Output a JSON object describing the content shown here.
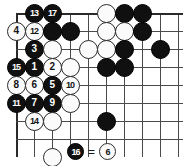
{
  "diagram": {
    "kind": "go-game-diagram",
    "board": {
      "origin_x": 16,
      "origin_y": 13,
      "spacing": 18,
      "cols": 10,
      "rows": 8,
      "left_edge": true,
      "top_edge": true,
      "star_points": [
        {
          "col": 8,
          "row": 2
        }
      ]
    },
    "stones": [
      {
        "col": 1,
        "row": 0,
        "color": "black",
        "label": "13"
      },
      {
        "col": 2,
        "row": 0,
        "color": "black",
        "label": "17"
      },
      {
        "col": 5,
        "row": 0,
        "color": "white",
        "label": ""
      },
      {
        "col": 6,
        "row": 0,
        "color": "black",
        "label": ""
      },
      {
        "col": 7,
        "row": 0,
        "color": "black",
        "label": ""
      },
      {
        "col": 0,
        "row": 1,
        "color": "white",
        "label": "4"
      },
      {
        "col": 1,
        "row": 1,
        "color": "white",
        "label": "12"
      },
      {
        "col": 2,
        "row": 1,
        "color": "black",
        "label": ""
      },
      {
        "col": 3,
        "row": 1,
        "color": "black",
        "label": ""
      },
      {
        "col": 5,
        "row": 1,
        "color": "white",
        "label": ""
      },
      {
        "col": 6,
        "row": 1,
        "color": "white",
        "label": ""
      },
      {
        "col": 7,
        "row": 1,
        "color": "black",
        "label": ""
      },
      {
        "col": 1,
        "row": 2,
        "color": "black",
        "label": "3"
      },
      {
        "col": 2,
        "row": 2,
        "color": "white",
        "label": ""
      },
      {
        "col": 4,
        "row": 2,
        "color": "white",
        "label": ""
      },
      {
        "col": 5,
        "row": 2,
        "color": "white",
        "label": ""
      },
      {
        "col": 6,
        "row": 2,
        "color": "black",
        "label": ""
      },
      {
        "col": 8,
        "row": 2,
        "color": "black",
        "label": ""
      },
      {
        "col": 0,
        "row": 3,
        "color": "black",
        "label": "15"
      },
      {
        "col": 1,
        "row": 3,
        "color": "black",
        "label": "1"
      },
      {
        "col": 2,
        "row": 3,
        "color": "white",
        "label": "2"
      },
      {
        "col": 3,
        "row": 3,
        "color": "white",
        "label": ""
      },
      {
        "col": 5,
        "row": 3,
        "color": "black",
        "label": ""
      },
      {
        "col": 6,
        "row": 3,
        "color": "black",
        "label": ""
      },
      {
        "col": 0,
        "row": 4,
        "color": "white",
        "label": "8"
      },
      {
        "col": 1,
        "row": 4,
        "color": "white",
        "label": "6"
      },
      {
        "col": 2,
        "row": 4,
        "color": "black",
        "label": "5"
      },
      {
        "col": 3,
        "row": 4,
        "color": "white",
        "label": "10"
      },
      {
        "col": 0,
        "row": 5,
        "color": "black",
        "label": "11"
      },
      {
        "col": 1,
        "row": 5,
        "color": "black",
        "label": "7"
      },
      {
        "col": 2,
        "row": 5,
        "color": "black",
        "label": "9"
      },
      {
        "col": 3,
        "row": 5,
        "color": "white",
        "label": ""
      },
      {
        "col": 1,
        "row": 6,
        "color": "white",
        "label": "14"
      },
      {
        "col": 2,
        "row": 6,
        "color": "white",
        "label": ""
      },
      {
        "col": 5,
        "row": 6,
        "color": "black",
        "label": ""
      },
      {
        "col": 2,
        "row": 8,
        "color": "white",
        "label": ""
      }
    ],
    "caption": {
      "left_stone": {
        "color": "black",
        "label": "16"
      },
      "equals": "=",
      "right_stone": {
        "color": "white",
        "label": "6"
      }
    }
  }
}
